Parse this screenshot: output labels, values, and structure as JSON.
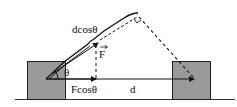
{
  "diagram": {
    "labels": {
      "angle": "θ",
      "force": "F",
      "force_component": "Fcosθ",
      "displacement": "d",
      "displacement_component": "dcosθ"
    },
    "colors": {
      "block_fill": "#9a9a9a",
      "block_stroke": "#222222",
      "line": "#111111",
      "background": "#ffffff"
    },
    "elements": [
      "ground-line",
      "left-block",
      "right-block",
      "displacement-arrow",
      "force-vector",
      "force-projection-dashed",
      "displacement-projection-line",
      "perpendicular-dashed-line",
      "right-angle-marker",
      "angle-arc"
    ]
  }
}
